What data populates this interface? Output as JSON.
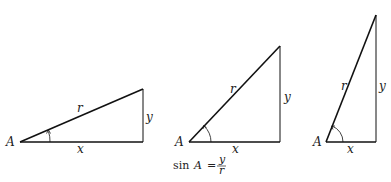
{
  "diagram": {
    "stroke_color": "#111111",
    "triangles": [
      {
        "id": "shallow",
        "vertex_label": "A",
        "hyp_label": "r",
        "opp_label": "y",
        "adj_label": "x"
      },
      {
        "id": "medium",
        "vertex_label": "A",
        "hyp_label": "r",
        "opp_label": "y",
        "adj_label": "x"
      },
      {
        "id": "steep",
        "vertex_label": "A",
        "hyp_label": "r",
        "opp_label": "y",
        "adj_label": "x"
      }
    ],
    "formula": {
      "func": "sin",
      "var": "A",
      "equals": "=",
      "numerator": "y",
      "denominator": "r"
    }
  }
}
